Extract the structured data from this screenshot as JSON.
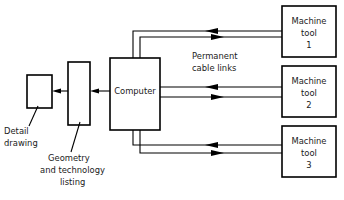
{
  "diagram": {
    "type": "block-flow-diagram",
    "stroke_color": "#000000",
    "fill_color": "#ffffff",
    "text_color": "#1a1a1a",
    "nodes": [
      {
        "id": "detail-drawing-box",
        "kind": "process-box",
        "label_lines": [],
        "x": 27,
        "y": 75,
        "w": 25,
        "h": 33
      },
      {
        "id": "geometry-listing-box",
        "kind": "process-box",
        "label_lines": [],
        "x": 68,
        "y": 62,
        "w": 22,
        "h": 63
      },
      {
        "id": "computer-box",
        "kind": "process-box",
        "label_lines": [
          "Computer"
        ],
        "x": 110,
        "y": 58,
        "w": 50,
        "h": 72
      },
      {
        "id": "machine-tool-1-box",
        "kind": "process-box",
        "label_lines": [
          "Machine",
          "tool",
          "1"
        ],
        "x": 282,
        "y": 6,
        "w": 54,
        "h": 51
      },
      {
        "id": "machine-tool-2-box",
        "kind": "process-box",
        "label_lines": [
          "Machine",
          "tool",
          "2"
        ],
        "x": 282,
        "y": 66,
        "w": 54,
        "h": 51
      },
      {
        "id": "machine-tool-3-box",
        "kind": "process-box",
        "label_lines": [
          "Machine",
          "tool",
          "3"
        ],
        "x": 282,
        "y": 126,
        "w": 54,
        "h": 51
      }
    ],
    "callouts": [
      {
        "id": "detail-drawing-callout",
        "lines": [
          "Detail",
          "drawing"
        ],
        "x": 4,
        "y": 131
      },
      {
        "id": "geometry-listing-callout",
        "lines": [
          "Geometry",
          "and technology",
          "listing"
        ],
        "x": 48,
        "y": 158
      }
    ],
    "annotations": [
      {
        "id": "permanent-cable-links-annotation",
        "lines": [
          "Permanent",
          "cable links"
        ],
        "x": 192,
        "y": 59
      }
    ],
    "computer_label": "Computer",
    "machine_tool_1_label_lines": [
      "Machine",
      "tool",
      "1"
    ],
    "machine_tool_2_label_lines": [
      "Machine",
      "tool",
      "2"
    ],
    "machine_tool_3_label_lines": [
      "Machine",
      "tool",
      "3"
    ],
    "connections": [
      {
        "id": "geometry-to-detail",
        "from": "geometry-listing-box",
        "to": "detail-drawing-box",
        "direction": "left",
        "style": "single-arrow"
      },
      {
        "id": "computer-to-geometry",
        "from": "computer-box",
        "to": "geometry-listing-box",
        "direction": "left",
        "style": "single-arrow"
      },
      {
        "id": "computer-machine-tool-1-upload",
        "from": "computer-box",
        "to": "machine-tool-1-box",
        "direction": "right",
        "style": "cable"
      },
      {
        "id": "computer-machine-tool-1-download",
        "from": "machine-tool-1-box",
        "to": "computer-box",
        "direction": "left",
        "style": "cable"
      },
      {
        "id": "computer-machine-tool-2-upload",
        "from": "computer-box",
        "to": "machine-tool-2-box",
        "direction": "right",
        "style": "cable"
      },
      {
        "id": "computer-machine-tool-2-download",
        "from": "machine-tool-2-box",
        "to": "computer-box",
        "direction": "left",
        "style": "cable"
      },
      {
        "id": "computer-machine-tool-3-upload",
        "from": "computer-box",
        "to": "machine-tool-3-box",
        "direction": "right",
        "style": "cable"
      },
      {
        "id": "computer-machine-tool-3-download",
        "from": "machine-tool-3-box",
        "to": "computer-box",
        "direction": "left",
        "style": "cable"
      }
    ]
  },
  "labels": {
    "computer": "Computer",
    "machine_1_line1": "Machine",
    "machine_1_line2": "tool",
    "machine_1_line3": "1",
    "machine_2_line1": "Machine",
    "machine_2_line2": "tool",
    "machine_2_line3": "2",
    "machine_3_line1": "Machine",
    "machine_3_line2": "tool",
    "machine_3_line3": "3",
    "detail_line1": "Detail",
    "detail_line2": "drawing",
    "geometry_line1": "Geometry",
    "geometry_line2": "and technology",
    "geometry_line3": "listing",
    "cable_line1": "Permanent",
    "cable_line2": "cable links"
  }
}
